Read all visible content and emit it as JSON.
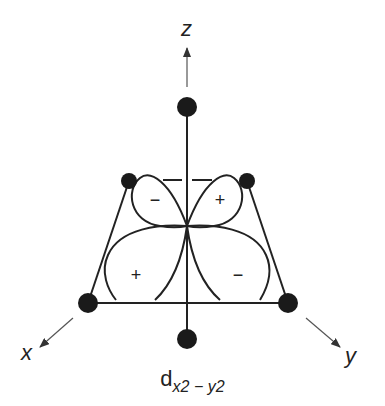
{
  "diagram": {
    "axes": {
      "z": {
        "label": "z"
      },
      "x": {
        "label": "x"
      },
      "y": {
        "label": "y"
      }
    },
    "lobes": [
      {
        "position": "back-left",
        "sign": "−"
      },
      {
        "position": "back-right",
        "sign": "+"
      },
      {
        "position": "front-left",
        "sign": "+"
      },
      {
        "position": "front-right",
        "sign": "−"
      }
    ],
    "ligands": [
      {
        "position": "top",
        "axis": "+z"
      },
      {
        "position": "bottom",
        "axis": "-z"
      },
      {
        "position": "back-left",
        "axis": "-y"
      },
      {
        "position": "back-right",
        "axis": "-x"
      },
      {
        "position": "front-left",
        "axis": "+x"
      },
      {
        "position": "front-right",
        "axis": "+y"
      }
    ],
    "caption": {
      "main": "d",
      "subscript": "x2 − y2"
    },
    "colors": {
      "line": "#222222",
      "ligand": "#1a1a1a",
      "arrow": "#555555",
      "background": "#ffffff"
    }
  }
}
